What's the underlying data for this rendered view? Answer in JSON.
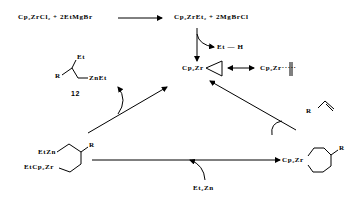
{
  "reaction": {
    "step1_reactants": "Cp₂ZrCl₂ + 2EtMgBr",
    "step1_products": "Cp₂ZrEt₂ + 2MgBrCl",
    "byproduct": "Et — H",
    "zirconacyclopropane": "Cp₂Zr",
    "alkene_complex": "Cp₂Zr·····",
    "alkene_substituent": "R",
    "zirconacyclopentane": "Cp₂Zr",
    "zirconacyclopentane_substituent": "R",
    "diethylzinc": "Et₂Zn",
    "intermediate_zn": "EtZn",
    "intermediate_zr": "EtCp₂Zr",
    "intermediate_substituent": "R",
    "product_et": "Et",
    "product_r": "R",
    "product_znet": "ZnEt",
    "product_number": "12"
  }
}
